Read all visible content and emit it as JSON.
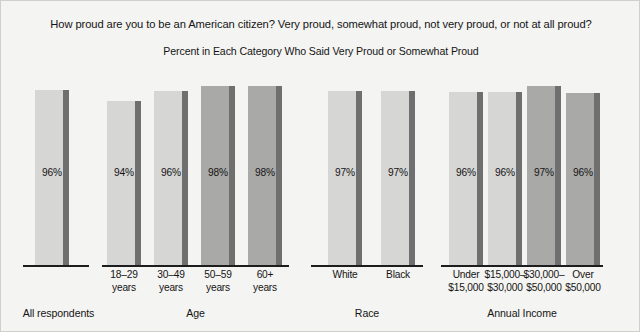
{
  "chart_data": {
    "type": "bar",
    "title": "How proud are you to be an American citizen? Very proud, somewhat proud, not very proud, or not at all proud?",
    "subtitle": "Percent in Each Category Who Said Very Proud or Somewhat Proud",
    "xlabel": "",
    "ylabel": "",
    "ylim": [
      0,
      100
    ],
    "grid": false,
    "legend": "none",
    "value_suffix": "%",
    "groups": [
      {
        "name": "All respondents",
        "bars": [
          {
            "label": "",
            "value": 96,
            "value_label": "96%",
            "shade": "light"
          }
        ]
      },
      {
        "name": "Age",
        "bars": [
          {
            "label": "18–29\nyears",
            "value": 94,
            "value_label": "94%",
            "shade": "light"
          },
          {
            "label": "30–49\nyears",
            "value": 96,
            "value_label": "96%",
            "shade": "light"
          },
          {
            "label": "50–59\nyears",
            "value": 98,
            "value_label": "98%",
            "shade": "medium"
          },
          {
            "label": "60+\nyears",
            "value": 98,
            "value_label": "98%",
            "shade": "medium"
          }
        ]
      },
      {
        "name": "Race",
        "bars": [
          {
            "label": "White",
            "value": 97,
            "value_label": "97%",
            "shade": "light"
          },
          {
            "label": "Black",
            "value": 97,
            "value_label": "97%",
            "shade": "light"
          }
        ]
      },
      {
        "name": "Annual Income",
        "bars": [
          {
            "label": "Under\n$15,000",
            "value": 96,
            "value_label": "96%",
            "shade": "light"
          },
          {
            "label": "$15,000–\n$30,000",
            "value": 96,
            "value_label": "96%",
            "shade": "light"
          },
          {
            "label": "$30,000–\n$50,000",
            "value": 97,
            "value_label": "97%",
            "shade": "medium"
          },
          {
            "label": "Over\n$50,000",
            "value": 96,
            "value_label": "96%",
            "shade": "medium"
          }
        ]
      }
    ],
    "colors": {
      "background": "#f4f4f2",
      "bar_light": "#d6d6d4",
      "bar_medium": "#a9a9a7",
      "bar_stripe": "#6f6f6f",
      "axis": "#1d1d1d",
      "text": "#141414"
    }
  },
  "layout": {
    "baseline_y": 264,
    "bar_width": 34,
    "stripe_width": 6,
    "value_label_y": 166,
    "groups": [
      {
        "axis_x": 22,
        "axis_w": 66,
        "label_x": 0,
        "label_w": 115,
        "label_y": 306,
        "bars": [
          {
            "x": 34,
            "top": 89
          }
        ],
        "tick_y": 268
      },
      {
        "axis_x": 101,
        "axis_w": 187,
        "label_x": 101,
        "label_w": 187,
        "label_y": 306,
        "bars": [
          {
            "x": 106,
            "top": 100
          },
          {
            "x": 153,
            "top": 90
          },
          {
            "x": 200,
            "top": 85
          },
          {
            "x": 247,
            "top": 85
          }
        ],
        "tick_y": 268
      },
      {
        "axis_x": 310,
        "axis_w": 112,
        "label_x": 310,
        "label_w": 112,
        "label_y": 306,
        "bars": [
          {
            "x": 327,
            "top": 90
          },
          {
            "x": 380,
            "top": 90
          }
        ],
        "tick_y": 268
      },
      {
        "axis_x": 440,
        "axis_w": 162,
        "label_x": 440,
        "label_w": 162,
        "label_y": 306,
        "bars": [
          {
            "x": 448,
            "top": 91
          },
          {
            "x": 487,
            "top": 91
          },
          {
            "x": 526,
            "top": 85
          },
          {
            "x": 565,
            "top": 92
          }
        ],
        "tick_y": 268
      }
    ]
  }
}
